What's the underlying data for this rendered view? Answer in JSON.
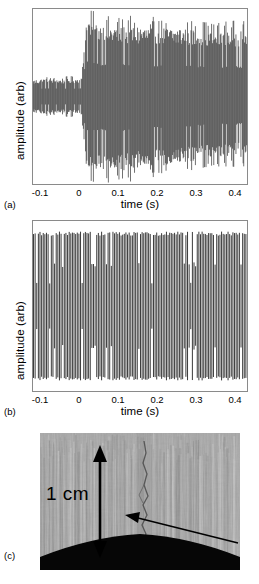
{
  "figure": {
    "panels": [
      {
        "letter": "(a)",
        "ylabel": "amplitude (arb)",
        "xlabel": "time (s)",
        "ticks": [
          "-0.1",
          "0",
          "0.1",
          "0.2",
          "0.3",
          "0.4"
        ]
      },
      {
        "letter": "(b)",
        "ylabel": "amplitude (arb)",
        "xlabel": "time (s)",
        "ticks": [
          "-0.1",
          "0",
          "0.1",
          "0.2",
          "0.3",
          "0.4"
        ]
      },
      {
        "letter": "(c)",
        "scale_label": "1 cm"
      }
    ]
  },
  "chart_data": [
    {
      "type": "line",
      "panel": "a",
      "title": "",
      "xlabel": "time (s)",
      "ylabel": "amplitude (arb)",
      "xlim": [
        -0.13,
        0.42
      ],
      "ylim": [
        -1.05,
        1.05
      ],
      "xticks": [
        -0.1,
        0,
        0.1,
        0.2,
        0.3,
        0.4
      ],
      "grid": false,
      "legend": null,
      "description": "Acoustic emission oscilloscope trace: low-amplitude noise band (about +/-0.22 arb) before t=0, abrupt jump at t=0 to a large-amplitude oscillation filling the frame (about +/-0.93 arb) which persists and decays slightly toward t=0.39 s, with spiky positive and negative envelope excursions.",
      "envelope": {
        "t": [
          -0.13,
          -0.12,
          -0.1,
          -0.08,
          -0.06,
          -0.04,
          -0.02,
          -0.005,
          0.0,
          0.005,
          0.01,
          0.02,
          0.03,
          0.05,
          0.07,
          0.09,
          0.11,
          0.13,
          0.15,
          0.17,
          0.19,
          0.21,
          0.23,
          0.25,
          0.27,
          0.29,
          0.31,
          0.33,
          0.35,
          0.37,
          0.39
        ],
        "upper": [
          0.2,
          0.21,
          0.22,
          0.22,
          0.21,
          0.22,
          0.22,
          0.23,
          0.62,
          0.92,
          0.97,
          0.93,
          0.9,
          0.88,
          0.87,
          0.88,
          0.86,
          0.87,
          0.86,
          0.85,
          0.86,
          0.85,
          0.84,
          0.85,
          0.84,
          0.83,
          0.84,
          0.83,
          0.82,
          0.83,
          0.82
        ],
        "lower": [
          -0.2,
          -0.21,
          -0.22,
          -0.22,
          -0.21,
          -0.22,
          -0.22,
          -0.23,
          -0.6,
          -0.9,
          -0.93,
          -0.92,
          -0.91,
          -0.93,
          -0.94,
          -0.93,
          -0.92,
          -0.9,
          -0.88,
          -0.86,
          -0.87,
          -0.86,
          -0.84,
          -0.83,
          -0.82,
          -0.81,
          -0.8,
          -0.79,
          -0.78,
          -0.77,
          -0.76
        ]
      }
    },
    {
      "type": "line",
      "panel": "b",
      "title": "",
      "xlabel": "time (s)",
      "ylabel": "amplitude (arb)",
      "xlim": [
        -0.13,
        0.42
      ],
      "ylim": [
        -1.05,
        1.05
      ],
      "xticks": [
        -0.1,
        0,
        0.1,
        0.2,
        0.3,
        0.4
      ],
      "grid": false,
      "legend": null,
      "description": "Continuous high-frequency oscillation of nearly constant large amplitude (about +/-0.92 arb) across the whole record from -0.1 s to 0.39 s, with no amplitude jump at t=0; individual cycles resolve as dense vertical stripes with irregular short-cycle gaps.",
      "envelope": {
        "t": [
          -0.13,
          -0.1,
          -0.05,
          0.0,
          0.05,
          0.1,
          0.15,
          0.2,
          0.25,
          0.3,
          0.35,
          0.39
        ],
        "upper": [
          0.92,
          0.92,
          0.92,
          0.92,
          0.92,
          0.92,
          0.92,
          0.92,
          0.92,
          0.92,
          0.92,
          0.92
        ],
        "lower": [
          -0.92,
          -0.92,
          -0.92,
          -0.92,
          -0.92,
          -0.92,
          -0.92,
          -0.92,
          -0.92,
          -0.92,
          -0.92,
          -0.92
        ]
      }
    }
  ]
}
